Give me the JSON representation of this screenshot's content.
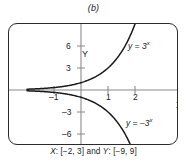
{
  "figure": {
    "top_caption": "(b)",
    "bottom_caption_x_name": "X",
    "bottom_caption_x_range": ": [−2, 3] and ",
    "bottom_caption_y_name": "Y",
    "bottom_caption_y_range": ": [−9, 9]",
    "bottom_caption_full": "X: [−2, 3] and Y: [−9, 9]"
  },
  "chart_data": {
    "type": "line",
    "title": "(b)",
    "xlabel": "X",
    "ylabel": "Y",
    "xlim": [
      -2,
      3
    ],
    "ylim": [
      -9,
      9
    ],
    "grid": false,
    "legend_position": "inline-annotation",
    "xticks": [
      -1,
      1,
      2
    ],
    "xticklabels": [
      "–1",
      "1",
      "2"
    ],
    "yticks": [
      6,
      3,
      -3,
      -6
    ],
    "yticklabels": [
      "6",
      "3",
      "–3",
      "–6"
    ],
    "series": [
      {
        "name": "y = 3^x",
        "label": "y = 3",
        "label_exponent": "x",
        "color": "#1a1a1a",
        "x": [
          -2,
          -1.75,
          -1.5,
          -1.25,
          -1,
          -0.75,
          -0.5,
          -0.25,
          0,
          0.25,
          0.5,
          0.75,
          1,
          1.25,
          1.5,
          1.75,
          2
        ],
        "values": [
          0.111,
          0.146,
          0.192,
          0.254,
          0.333,
          0.439,
          0.577,
          0.76,
          1.0,
          1.316,
          1.732,
          2.28,
          3.0,
          3.948,
          5.196,
          6.839,
          9.0
        ]
      },
      {
        "name": "y = -3^x",
        "label": "y = –3",
        "label_exponent": "x",
        "color": "#1a1a1a",
        "x": [
          -2,
          -1.75,
          -1.5,
          -1.25,
          -1,
          -0.75,
          -0.5,
          -0.25,
          0,
          0.25,
          0.5,
          0.75,
          1,
          1.25,
          1.5,
          1.75,
          2
        ],
        "values": [
          -0.111,
          -0.146,
          -0.192,
          -0.254,
          -0.333,
          -0.439,
          -0.577,
          -0.76,
          -1.0,
          -1.316,
          -1.732,
          -2.28,
          -3.0,
          -3.948,
          -5.196,
          -6.839,
          -9.0
        ]
      }
    ]
  },
  "axes": {
    "y_letter": "Y",
    "x_letter": "X"
  }
}
